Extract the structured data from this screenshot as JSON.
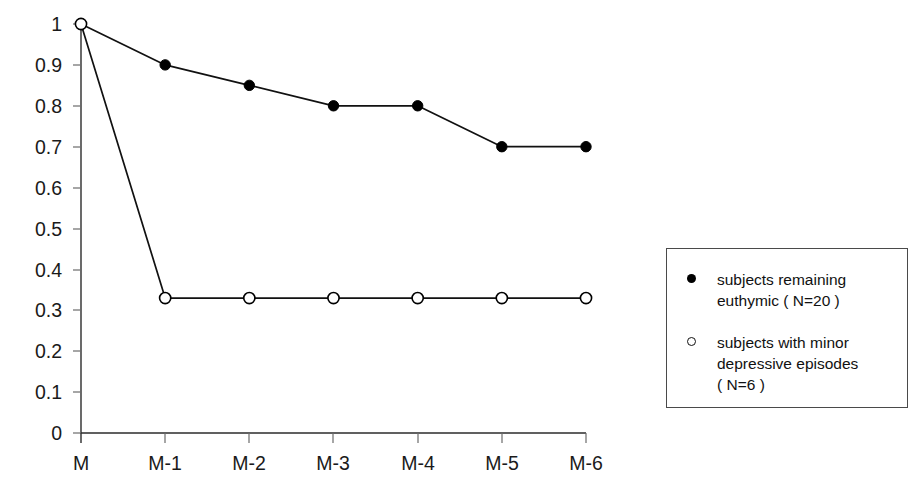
{
  "chart_data": {
    "type": "line",
    "title": "",
    "subtitle": "",
    "xlabel": "",
    "ylabel": "",
    "categories": [
      "M",
      "M-1",
      "M-2",
      "M-3",
      "M-4",
      "M-5",
      "M-6"
    ],
    "ylim": [
      0,
      1
    ],
    "yticks": [
      "0",
      "0.1",
      "0.2",
      "0.3",
      "0.4",
      "0.5",
      "0.6",
      "0.7",
      "0.8",
      "0.9",
      "1"
    ],
    "ytick_values": [
      0,
      0.1,
      0.2,
      0.3,
      0.4,
      0.5,
      0.6,
      0.7,
      0.8,
      0.9,
      1
    ],
    "grid": false,
    "legend_position": "right",
    "series": [
      {
        "name": "subjects remaining euthymic ( N=20 )",
        "marker": "filled-circle",
        "color": "#000000",
        "values": [
          1.0,
          0.9,
          0.85,
          0.8,
          0.8,
          0.7,
          0.7
        ]
      },
      {
        "name": "subjects with minor depressive episodes ( N=6 )",
        "marker": "open-circle",
        "color": "#000000",
        "values": [
          1.0,
          0.33,
          0.33,
          0.33,
          0.33,
          0.33,
          0.33
        ]
      }
    ]
  },
  "legend": {
    "entries": [
      {
        "marker": "filled-circle",
        "label": "subjects remaining\neuthymic   ( N=20 )"
      },
      {
        "marker": "open-circle",
        "label": "subjects with minor\ndepressive episodes\n( N=6 )"
      }
    ]
  },
  "colors": {
    "axis": "#2b2b2b",
    "series": "#000000",
    "legend_border": "#4a4a4a",
    "background": "#ffffff"
  }
}
